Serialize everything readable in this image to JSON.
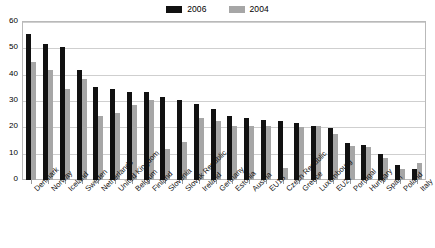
{
  "chart_data": {
    "type": "bar",
    "title": "",
    "xlabel": "",
    "ylabel": "",
    "ylim": [
      0,
      60
    ],
    "yticks": [
      0,
      10,
      20,
      30,
      40,
      50,
      60
    ],
    "grid": true,
    "legend_position": "top-center",
    "categories": [
      "Denmark",
      "Norway",
      "Iceland",
      "Sweden",
      "Netherlands",
      "United Kingdom",
      "Belgium",
      "Finland",
      "Slovenia",
      "Slovak Republic",
      "Ireland",
      "Germany",
      "Estonia",
      "Austria",
      "EU15",
      "Czech Republic",
      "Greece",
      "Luxembourg",
      "EU27",
      "Portugal",
      "Hungary",
      "Spain",
      "Poland",
      "Italy"
    ],
    "series": [
      {
        "name": "2006",
        "color": "#111111",
        "values": [
          55.5,
          51.7,
          50.7,
          41.8,
          35.5,
          34.5,
          33.6,
          33.6,
          31.5,
          30.5,
          28.7,
          26.8,
          24.2,
          23.4,
          22.8,
          22.4,
          21.6,
          20.6,
          19.8,
          14.2,
          13.4,
          9.8,
          5.8,
          4.2
        ]
      },
      {
        "name": "2004",
        "color": "#a6a6a6",
        "values": [
          44.8,
          41.6,
          34.4,
          38.3,
          24.4,
          25.4,
          28.6,
          30.5,
          11.8,
          14.4,
          23.6,
          22.6,
          20.6,
          20.4,
          20.5,
          4.5,
          20.2,
          20.5,
          17.5,
          12.8,
          12.6,
          8.2,
          4.0,
          6.6
        ]
      }
    ]
  },
  "legend": {
    "items": [
      {
        "label": "2006",
        "color": "#111111"
      },
      {
        "label": "2004",
        "color": "#a6a6a6"
      }
    ]
  }
}
